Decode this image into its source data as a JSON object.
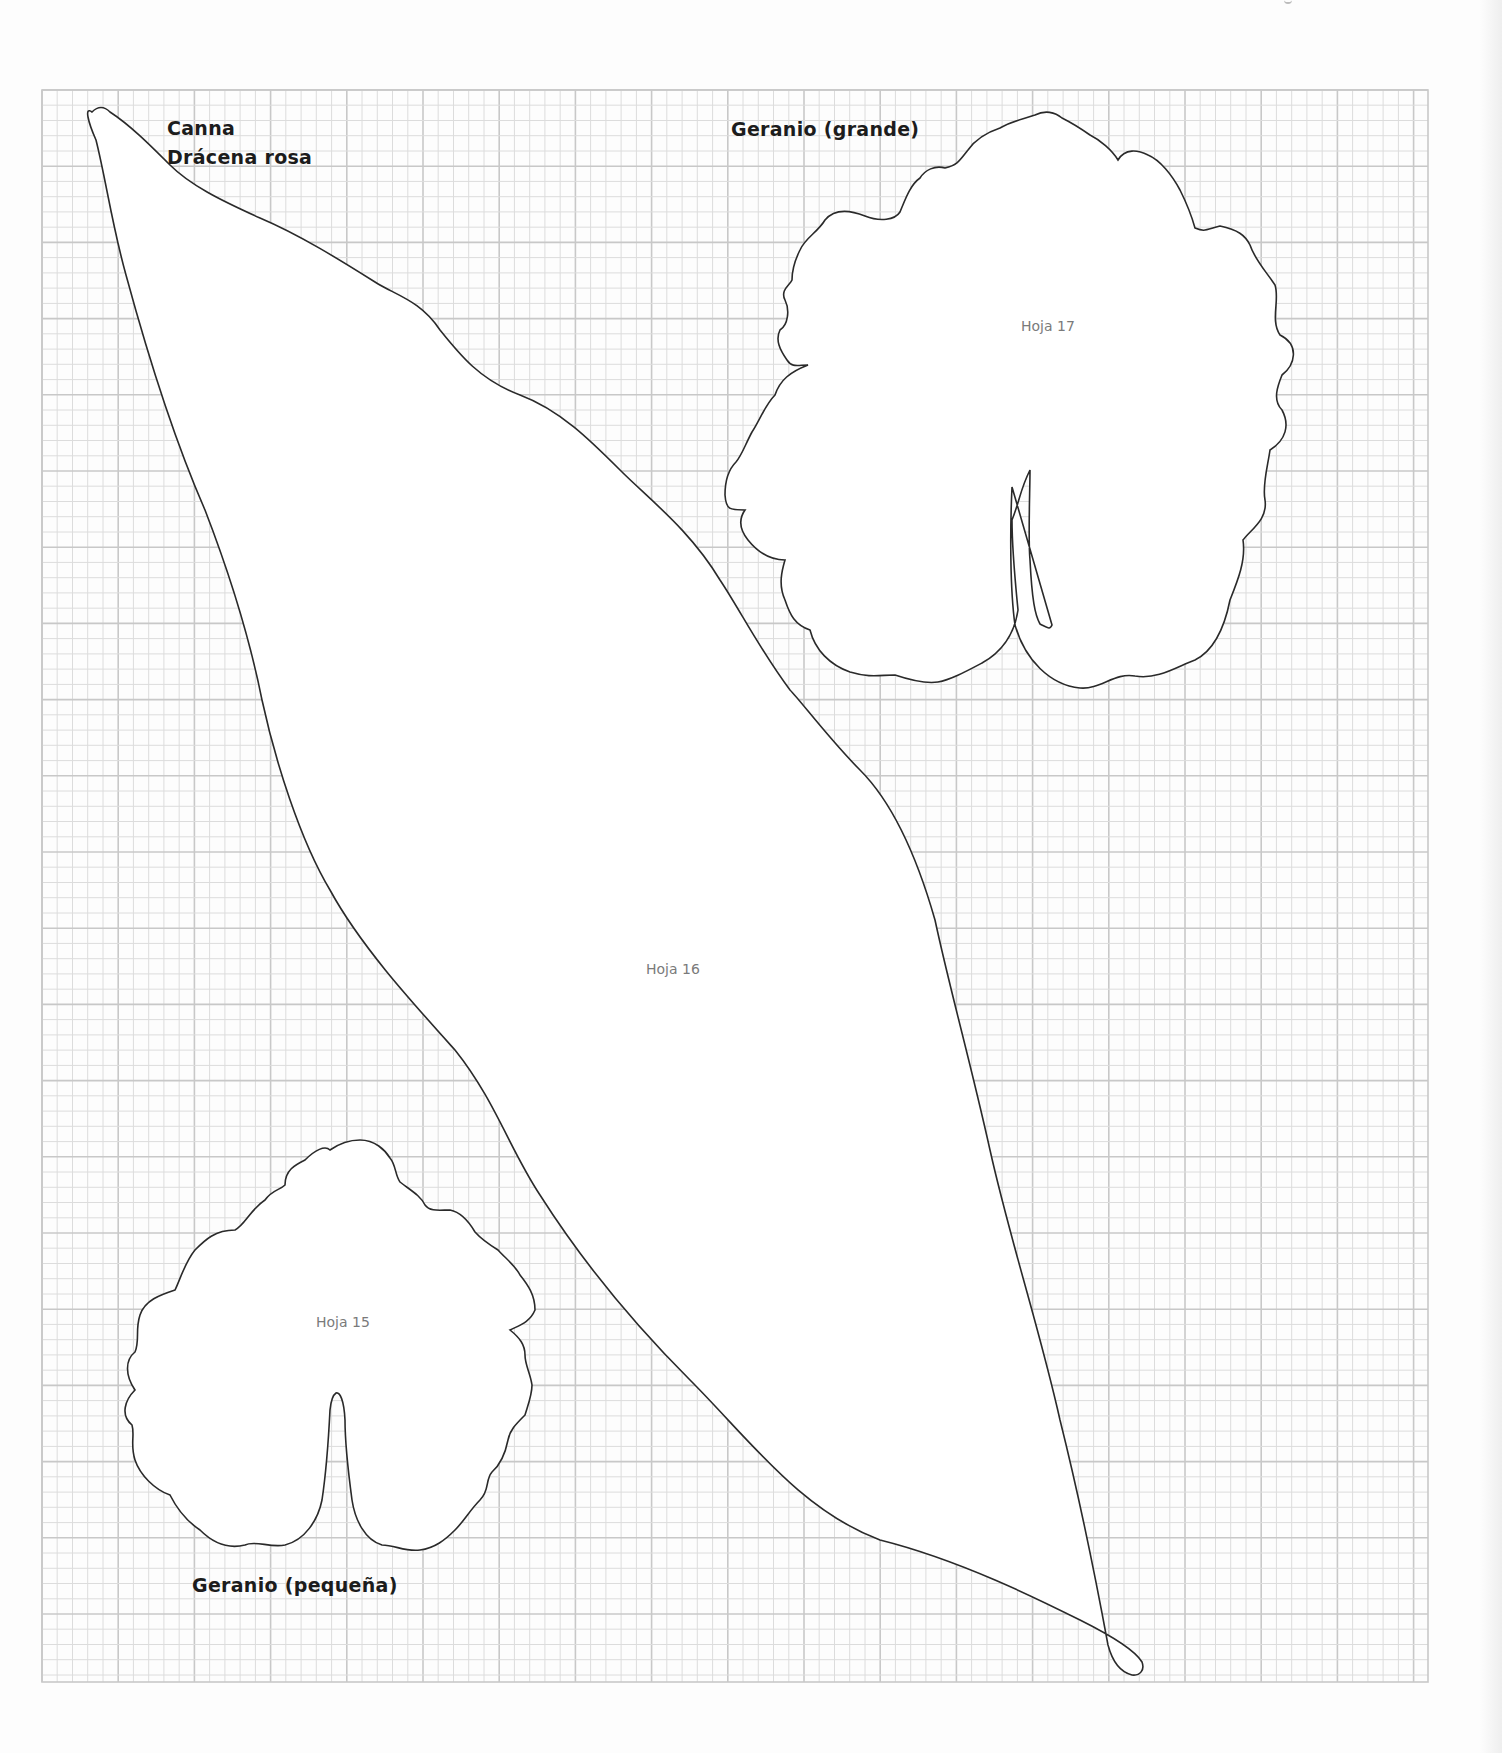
{
  "page": {
    "background": "#fdfdfd",
    "grid": {
      "line_color_minor": "#dcdcdc",
      "line_color_major": "#c8c8c8",
      "left": 42,
      "top": 90,
      "right": 1428,
      "bottom": 1682,
      "major_step": 76.2,
      "minor_divisions": 5
    },
    "outline_color": "#2a2a2a"
  },
  "templates": [
    {
      "id": "canna",
      "title_lines": [
        "Canna",
        "Drácena rosa"
      ],
      "piece_label": "Hoja 16"
    },
    {
      "id": "geranio-grande",
      "title": "Geranio (grande)",
      "piece_label": "Hoja 17"
    },
    {
      "id": "geranio-pequena",
      "title": "Geranio (pequeña)",
      "piece_label": "Hoja 15"
    }
  ]
}
